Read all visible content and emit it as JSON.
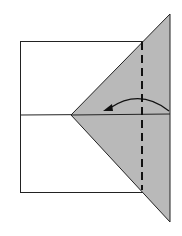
{
  "diagram": {
    "type": "origami-fold-step",
    "colors": {
      "paper": "#ffffff",
      "flap": "#b9b9b9",
      "line": "#222222"
    },
    "elements": [
      {
        "name": "paper-rectangle",
        "shape": "rect"
      },
      {
        "name": "center-crease",
        "shape": "line"
      },
      {
        "name": "folded-triangle-flap",
        "shape": "polygon"
      },
      {
        "name": "valley-fold-line",
        "shape": "dashed-line"
      },
      {
        "name": "fold-direction-arrow",
        "shape": "curved-arrow",
        "direction": "right-to-left"
      }
    ]
  }
}
